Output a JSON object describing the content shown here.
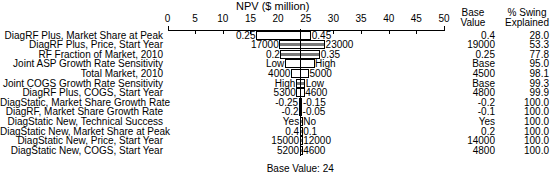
{
  "chart_data": {
    "type": "bar",
    "subtype": "tornado",
    "title": "NPV ($ million)",
    "xlabel": "NPV ($ million)",
    "ylabel": "",
    "xlim": [
      0,
      50
    ],
    "xticks": [
      0,
      5,
      10,
      15,
      20,
      25,
      30,
      35,
      40,
      45,
      50
    ],
    "xtick_labels": [
      "0",
      "5",
      "10",
      "15",
      "20",
      "25",
      "30",
      "35",
      "40",
      "45",
      "50"
    ],
    "grid": false,
    "legend": false,
    "base_value": 24,
    "base_value_note": "Base Value: 24",
    "columns": [
      "Base Value",
      "% Swing Explained"
    ],
    "categories": [
      "DiagRF Plus, Market Share at Peak",
      "DiagRF Plus, Price, Start Year",
      "RF Fraction of Market, 2010",
      "Joint ASP Growth Rate Sensitivity",
      "Total Market, 2010",
      "Joint COGS Growth Rate Sensitivity",
      "DiagRF Plus, COGS, Start Year",
      "DiagStatic, Market Share Growth Rate",
      "DiagRF, Market Share Growth Rate",
      "DiagStatic New, Technical Success",
      "DiagStatic New, Market Share at Peak",
      "DiagStatic New, Price, Start Year",
      "DiagStatic New, COGS, Start Year"
    ],
    "rows": [
      {
        "label": "DiagRF Plus, Market Share at Peak",
        "low_label": "0.25",
        "high_label": "0.45",
        "npv_low": 16.0,
        "npv_high": 26.0,
        "base_value": "0.4",
        "swing": "28.0",
        "shaded": false
      },
      {
        "label": "DiagRF Plus, Price, Start Year",
        "low_label": "17000",
        "high_label": "23000",
        "npv_low": 20.2,
        "npv_high": 28.5,
        "base_value": "19000",
        "swing": "53.3",
        "shaded": true
      },
      {
        "label": "RF Fraction of Market, 2010",
        "low_label": "0.2",
        "high_label": "0.35",
        "npv_low": 20.4,
        "npv_high": 27.6,
        "base_value": "0.25",
        "swing": "77.8",
        "shaded": true
      },
      {
        "label": "Joint ASP Growth Rate Sensitivity",
        "low_label": "Low",
        "high_label": "High",
        "npv_low": 21.2,
        "npv_high": 26.6,
        "base_value": "Base",
        "swing": "95.0",
        "shaded": false
      },
      {
        "label": "Total Market, 2010",
        "low_label": "4000",
        "high_label": "5000",
        "npv_low": 22.3,
        "npv_high": 25.6,
        "base_value": "4500",
        "swing": "98.1",
        "shaded": false
      },
      {
        "label": "Joint COGS Growth Rate Sensitivity",
        "low_label": "High",
        "high_label": "Low",
        "npv_low": 23.2,
        "npv_high": 24.9,
        "base_value": "Base",
        "swing": "99.3",
        "shaded": true
      },
      {
        "label": "DiagRF Plus, COGS, Start Year",
        "low_label": "5300",
        "high_label": "4600",
        "npv_low": 23.3,
        "npv_high": 24.8,
        "base_value": "4800",
        "swing": "99.9",
        "shaded": false
      },
      {
        "label": "DiagStatic, Market Share Growth Rate",
        "low_label": "-0.25",
        "high_label": "-0.15",
        "npv_low": 23.7,
        "npv_high": 24.4,
        "base_value": "-0.2",
        "swing": "100.0",
        "shaded": true
      },
      {
        "label": "DiagRF, Market Share Growth Rate",
        "low_label": "-0.2",
        "high_label": "-0.05",
        "npv_low": 23.8,
        "npv_high": 24.3,
        "base_value": "-0.1",
        "swing": "100.0",
        "shaded": true
      },
      {
        "label": "DiagStatic New, Technical Success",
        "low_label": "Yes",
        "high_label": "No",
        "npv_low": 23.9,
        "npv_high": 24.2,
        "base_value": "Yes",
        "swing": "100.0",
        "shaded": true
      },
      {
        "label": "DiagStatic New, Market Share at Peak",
        "low_label": "0.4",
        "high_label": "0.1",
        "npv_low": 23.9,
        "npv_high": 24.2,
        "base_value": "0.2",
        "swing": "100.0",
        "shaded": true
      },
      {
        "label": "DiagStatic New, Price, Start Year",
        "low_label": "15000",
        "high_label": "12000",
        "npv_low": 23.9,
        "npv_high": 24.1,
        "base_value": "14000",
        "swing": "100.0",
        "shaded": true
      },
      {
        "label": "DiagStatic New, COGS, Start Year",
        "low_label": "5200",
        "high_label": "4600",
        "npv_low": 23.9,
        "npv_high": 24.1,
        "base_value": "4800",
        "swing": "100.0",
        "shaded": true
      }
    ]
  },
  "headers": {
    "base_value": "Base\nValue",
    "base_value_line1": "Base",
    "base_value_line2": "Value",
    "swing_line1": "% Swing",
    "swing_line2": "Explained"
  }
}
